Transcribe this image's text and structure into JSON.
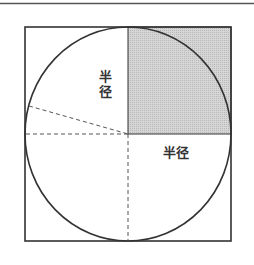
{
  "figure": {
    "type": "geometry-diagram",
    "labels": {
      "radius_vertical_char1": "半",
      "radius_vertical_char2": "径",
      "radius_horizontal": "半径"
    },
    "colors": {
      "stroke": "#333333",
      "shaded_fill": "#cdcdcd",
      "dashed": "#555555",
      "background": "#ffffff"
    }
  }
}
